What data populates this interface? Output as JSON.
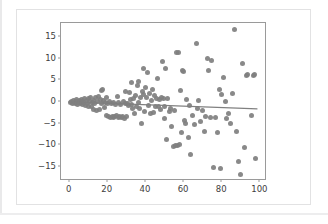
{
  "chart_data": {
    "type": "scatter",
    "title": "",
    "xlabel": "",
    "ylabel": "",
    "xlim": [
      -4,
      104
    ],
    "ylim": [
      -18.5,
      18.0
    ],
    "grid": false,
    "legend": null,
    "xticks": [
      0,
      20,
      40,
      60,
      80,
      100
    ],
    "yticks": [
      -15,
      -10,
      -5,
      0,
      5,
      10,
      15
    ],
    "xticklabels": [
      "0",
      "20",
      "40",
      "60",
      "80",
      "100"
    ],
    "yticklabels": [
      "−15",
      "−10",
      "−5",
      "0",
      "5",
      "10",
      "15"
    ],
    "marker_color": "#7f7f7f",
    "line_color": "#808080",
    "frame_color": "#9a9a9a",
    "background": "#ffffff",
    "series": [
      {
        "name": "observations",
        "marker": "circle",
        "points": [
          [
            1.0,
            -0.3
          ],
          [
            1.6,
            -0.2
          ],
          [
            2.1,
            -0.5
          ],
          [
            2.5,
            0.1
          ],
          [
            3.0,
            -0.4
          ],
          [
            3.4,
            -0.6
          ],
          [
            3.9,
            -0.2
          ],
          [
            4.3,
            0.3
          ],
          [
            4.8,
            -0.8
          ],
          [
            5.2,
            -0.3
          ],
          [
            5.7,
            0.2
          ],
          [
            6.1,
            -0.7
          ],
          [
            6.6,
            -0.1
          ],
          [
            7.0,
            0.4
          ],
          [
            7.5,
            -0.9
          ],
          [
            7.9,
            -0.4
          ],
          [
            8.4,
            0.6
          ],
          [
            8.8,
            -1.0
          ],
          [
            9.3,
            0.0
          ],
          [
            9.7,
            -0.6
          ],
          [
            10.2,
            0.5
          ],
          [
            10.6,
            -1.2
          ],
          [
            11.1,
            -0.2
          ],
          [
            11.5,
            0.8
          ],
          [
            12.0,
            -1.4
          ],
          [
            12.4,
            -0.3
          ],
          [
            12.9,
            0.2
          ],
          [
            13.3,
            -2.0
          ],
          [
            13.8,
            -0.5
          ],
          [
            14.2,
            0.9
          ],
          [
            14.7,
            -2.2
          ],
          [
            15.1,
            -0.1
          ],
          [
            15.6,
            1.1
          ],
          [
            16.0,
            -1.9
          ],
          [
            16.5,
            0.4
          ],
          [
            17.0,
            2.4
          ],
          [
            17.4,
            -0.7
          ],
          [
            17.9,
            2.6
          ],
          [
            18.3,
            0.1
          ],
          [
            18.8,
            -1.5
          ],
          [
            19.2,
            -0.4
          ],
          [
            19.7,
            0.7
          ],
          [
            20.1,
            -3.3
          ],
          [
            20.6,
            -0.6
          ],
          [
            21.0,
            -3.6
          ],
          [
            21.5,
            -0.2
          ],
          [
            21.9,
            -3.8
          ],
          [
            22.4,
            -0.5
          ],
          [
            22.8,
            -3.7
          ],
          [
            23.3,
            -3.9
          ],
          [
            23.7,
            -0.4
          ],
          [
            24.2,
            -3.6
          ],
          [
            24.6,
            -0.9
          ],
          [
            25.1,
            -3.4
          ],
          [
            25.5,
            1.0
          ],
          [
            26.0,
            -3.8
          ],
          [
            26.4,
            -0.3
          ],
          [
            26.9,
            -3.5
          ],
          [
            27.3,
            -0.8
          ],
          [
            27.8,
            -3.9
          ],
          [
            28.2,
            -3.7
          ],
          [
            28.7,
            -0.2
          ],
          [
            29.1,
            -4.0
          ],
          [
            29.6,
            -0.6
          ],
          [
            30.0,
            2.1
          ],
          [
            30.5,
            -3.6
          ],
          [
            31.0,
            -0.5
          ],
          [
            31.4,
            -1.0
          ],
          [
            31.9,
            1.9
          ],
          [
            32.3,
            0.4
          ],
          [
            32.8,
            -0.9
          ],
          [
            33.2,
            4.2
          ],
          [
            33.7,
            -1.7
          ],
          [
            34.1,
            0.6
          ],
          [
            34.6,
            -2.8
          ],
          [
            35.0,
            1.3
          ],
          [
            35.5,
            -1.2
          ],
          [
            35.9,
            3.5
          ],
          [
            36.4,
            -0.4
          ],
          [
            36.8,
            4.5
          ],
          [
            37.3,
            -1.8
          ],
          [
            37.7,
            0.8
          ],
          [
            38.2,
            -5.3
          ],
          [
            38.6,
            2.2
          ],
          [
            39.1,
            7.6
          ],
          [
            39.5,
            1.5
          ],
          [
            40.0,
            -2.5
          ],
          [
            40.5,
            3.1
          ],
          [
            41.0,
            0.9
          ],
          [
            41.5,
            6.6
          ],
          [
            42.0,
            -1.1
          ],
          [
            42.5,
            1.8
          ],
          [
            43.0,
            -3.0
          ],
          [
            43.5,
            0.2
          ],
          [
            44.0,
            2.7
          ],
          [
            44.5,
            -2.6
          ],
          [
            45.0,
            1.2
          ],
          [
            45.5,
            -1.4
          ],
          [
            46.0,
            0.6
          ],
          [
            46.5,
            5.2
          ],
          [
            47.0,
            -1.3
          ],
          [
            47.5,
            0.3
          ],
          [
            48.0,
            -2.0
          ],
          [
            48.5,
            0.7
          ],
          [
            49.0,
            9.0
          ],
          [
            49.5,
            0.5
          ],
          [
            50.0,
            -1.2
          ],
          [
            50.5,
            -4.0
          ],
          [
            51.0,
            7.6
          ],
          [
            51.5,
            -8.8
          ],
          [
            52.0,
            0.6
          ],
          [
            53.0,
            -2.5
          ],
          [
            53.5,
            -1.8
          ],
          [
            54.0,
            -5.8
          ],
          [
            55.0,
            -10.6
          ],
          [
            55.5,
            -2.2
          ],
          [
            56.0,
            -10.4
          ],
          [
            56.5,
            11.3
          ],
          [
            57.0,
            -10.2
          ],
          [
            57.5,
            11.1
          ],
          [
            58.0,
            -10.1
          ],
          [
            58.5,
            2.4
          ],
          [
            59.0,
            -7.3
          ],
          [
            59.5,
            7.0
          ],
          [
            60.0,
            6.7
          ],
          [
            60.5,
            -4.5
          ],
          [
            61.5,
            -5.2
          ],
          [
            62.0,
            0.4
          ],
          [
            63.0,
            -8.5
          ],
          [
            63.5,
            -1.0
          ],
          [
            64.0,
            -12.4
          ],
          [
            65.0,
            -3.4
          ],
          [
            66.0,
            -5.4
          ],
          [
            67.0,
            13.2
          ],
          [
            67.5,
            -1.7
          ],
          [
            68.0,
            0.0
          ],
          [
            69.0,
            -4.8
          ],
          [
            70.0,
            -2.1
          ],
          [
            71.0,
            -7.1
          ],
          [
            72.0,
            -3.6
          ],
          [
            73.0,
            9.9
          ],
          [
            73.5,
            7.1
          ],
          [
            74.5,
            -3.9
          ],
          [
            75.0,
            9.4
          ],
          [
            76.0,
            -15.3
          ],
          [
            77.0,
            -3.8
          ],
          [
            78.0,
            -7.4
          ],
          [
            79.0,
            2.7
          ],
          [
            79.5,
            -15.6
          ],
          [
            80.0,
            1.5
          ],
          [
            81.0,
            5.3
          ],
          [
            82.0,
            -0.2
          ],
          [
            83.0,
            -4.0
          ],
          [
            84.0,
            -2.9
          ],
          [
            85.0,
            -5.3
          ],
          [
            86.0,
            1.7
          ],
          [
            87.0,
            16.6
          ],
          [
            88.0,
            -7.0
          ],
          [
            89.0,
            -14.0
          ],
          [
            90.0,
            -17.0
          ],
          [
            91.0,
            8.7
          ],
          [
            92.0,
            -10.7
          ],
          [
            93.0,
            5.8
          ],
          [
            94.0,
            6.0
          ],
          [
            96.0,
            -3.3
          ],
          [
            97.0,
            5.9
          ],
          [
            97.5,
            6.2
          ],
          [
            98.0,
            -13.2
          ]
        ]
      }
    ],
    "trendline": {
      "type": "linear-fit",
      "x": [
        0,
        100
      ],
      "y": [
        -0.45,
        -2.1
      ]
    }
  }
}
